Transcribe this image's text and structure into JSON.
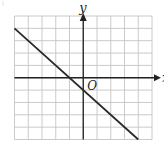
{
  "figure": {
    "type": "coordinate-grid-line-graph",
    "grid": {
      "x_min": -5,
      "x_max": 5,
      "y_min": -5,
      "y_max": 5,
      "step": 1
    },
    "axes": {
      "x_label": "x",
      "y_label": "y",
      "origin_label": "O"
    },
    "line": {
      "equation": "y = -x - 1",
      "slope": -1,
      "y_intercept": -1,
      "x_intercept": -1,
      "from": [
        -5,
        4
      ],
      "to": [
        4,
        -5
      ]
    },
    "colors": {
      "grid": "#c4c4c4",
      "axis": "#222222",
      "line": "#2a2a2a",
      "background": "#ffffff"
    }
  },
  "chart_data": {
    "type": "line",
    "title": "",
    "xlabel": "x",
    "ylabel": "y",
    "series": [
      {
        "name": "line",
        "x": [
          -5,
          -4,
          -3,
          -2,
          -1,
          0,
          1,
          2,
          3,
          4
        ],
        "y": [
          4,
          3,
          2,
          1,
          0,
          -1,
          -2,
          -3,
          -4,
          -5
        ]
      }
    ],
    "xlim": [
      -5,
      5
    ],
    "ylim": [
      -5,
      5
    ],
    "grid": true,
    "annotations": [
      "O"
    ]
  }
}
